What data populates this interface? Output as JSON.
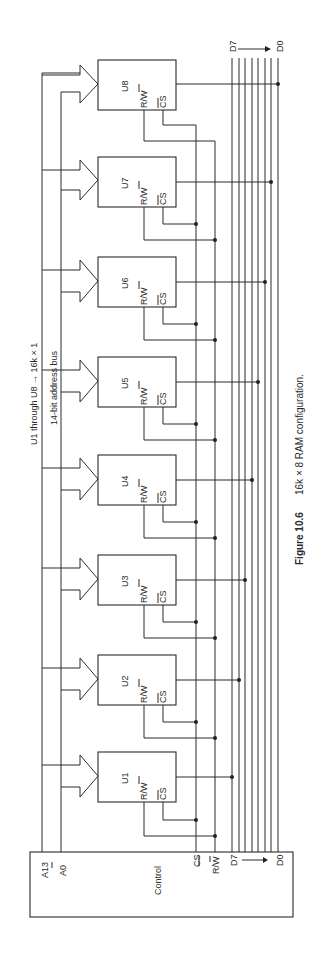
{
  "figure": {
    "caption_number": "Figure 10.6",
    "caption_text": "16k × 8 RAM configuration.",
    "note": "U1 through U8 → 16k × 1",
    "address_bus_label": "14-bit address bus"
  },
  "control": {
    "label": "Control",
    "address_top": "A13",
    "address_bottom": "A0",
    "cs_label": "CS",
    "rw_label": "R/W",
    "data_top": "D7",
    "data_bottom": "D0"
  },
  "chips": [
    {
      "name": "U1",
      "rw": "R/W",
      "cs": "CS",
      "data_bit": "D0"
    },
    {
      "name": "U2",
      "rw": "R/W",
      "cs": "CS",
      "data_bit": "D1"
    },
    {
      "name": "U3",
      "rw": "R/W",
      "cs": "CS",
      "data_bit": "D2"
    },
    {
      "name": "U4",
      "rw": "R/W",
      "cs": "CS",
      "data_bit": "D3"
    },
    {
      "name": "U5",
      "rw": "R/W",
      "cs": "CS",
      "data_bit": "D4"
    },
    {
      "name": "U6",
      "rw": "R/W",
      "cs": "CS",
      "data_bit": "D5"
    },
    {
      "name": "U7",
      "rw": "R/W",
      "cs": "CS",
      "data_bit": "D6"
    },
    {
      "name": "U8",
      "rw": "R/W",
      "cs": "CS",
      "data_bit": "D7"
    }
  ],
  "data_bus": {
    "top": "D7",
    "bottom": "D0"
  }
}
